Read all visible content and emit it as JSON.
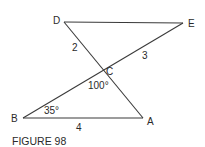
{
  "figure": {
    "caption": "FIGURE 98",
    "points": {
      "A": {
        "label": "A"
      },
      "B": {
        "label": "B"
      },
      "C": {
        "label": "C"
      },
      "D": {
        "label": "D"
      },
      "E": {
        "label": "E"
      }
    },
    "segment_lengths": {
      "DC": "2",
      "CE": "3",
      "BA": "4"
    },
    "angles": {
      "BCA": "100°",
      "CBA": "35°"
    },
    "line_color": "#3a3a3a",
    "text_color": "#2a2a2a"
  }
}
